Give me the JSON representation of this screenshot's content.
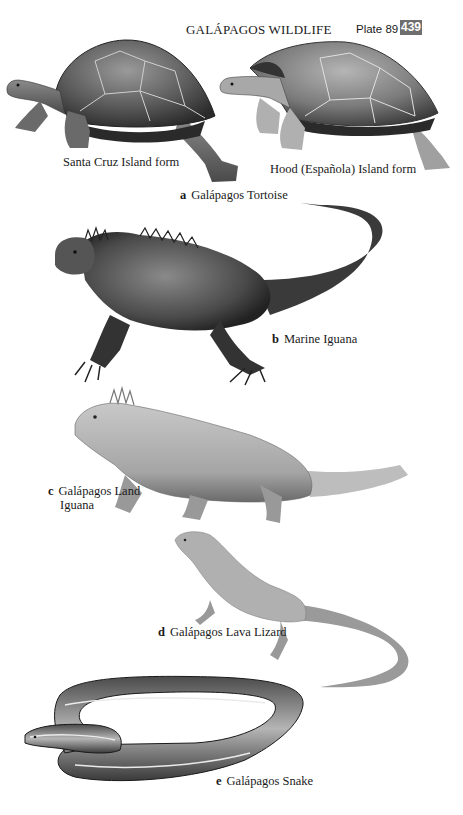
{
  "header": {
    "title": "GALÁPAGOS WILDLIFE",
    "plate": "Plate 89",
    "page_number": "439",
    "badge_color": "#6e6e6e"
  },
  "species": [
    {
      "letter": "a",
      "name": "Galápagos Tortoise",
      "forms": [
        {
          "label": "Santa Cruz Island form"
        },
        {
          "label": "Hood (Española) Island form"
        }
      ]
    },
    {
      "letter": "b",
      "name": "Marine Iguana"
    },
    {
      "letter": "c",
      "name_line1": "Galápagos Land",
      "name_line2": "Iguana"
    },
    {
      "letter": "d",
      "name": "Galápagos Lava Lizard"
    },
    {
      "letter": "e",
      "name": "Galápagos Snake"
    }
  ]
}
